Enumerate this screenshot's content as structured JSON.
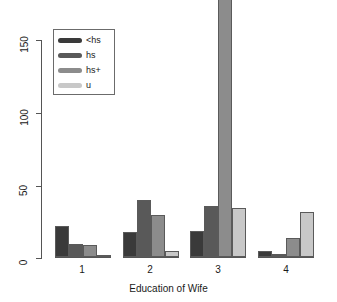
{
  "chart_data": {
    "type": "bar",
    "title": "",
    "xlabel": "Education of Wife",
    "ylabel": "",
    "categories": [
      "1",
      "2",
      "3",
      "4"
    ],
    "series": [
      {
        "name": "<hs",
        "color": "#3a3a3a",
        "values": [
          21,
          17,
          18,
          4
        ]
      },
      {
        "name": "hs",
        "color": "#595959",
        "values": [
          9,
          39,
          35,
          2
        ]
      },
      {
        "name": "hs+",
        "color": "#8c8c8c",
        "values": [
          8,
          29,
          180,
          13
        ]
      },
      {
        "name": "u",
        "color": "#c8c8c8",
        "values": [
          1,
          4,
          34,
          31
        ]
      }
    ],
    "ylim": [
      0,
      175
    ],
    "yticks": [
      0,
      50,
      100,
      150
    ],
    "ytick_labels": [
      "0",
      "50",
      "100",
      "150"
    ],
    "grid": false,
    "legend_position": "top-left"
  },
  "legend": {
    "entries": [
      {
        "label": "<hs"
      },
      {
        "label": "hs"
      },
      {
        "label": "hs+"
      },
      {
        "label": "u"
      }
    ]
  },
  "axes": {
    "x_title": "Education of Wife",
    "x_tick_labels": [
      "1",
      "2",
      "3",
      "4"
    ],
    "y_tick_labels": [
      "0",
      "50",
      "100",
      "150"
    ]
  }
}
